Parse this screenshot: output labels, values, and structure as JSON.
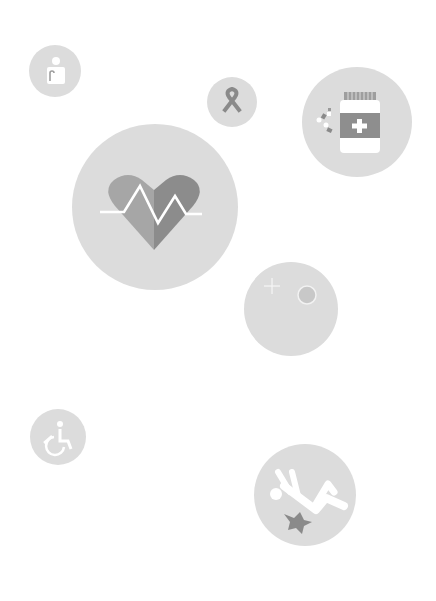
{
  "colors": {
    "background": "#ffffff",
    "circle_fill": "#dcdcdc",
    "icon_dark": "#8a8a8a",
    "icon_mid": "#9e9e9e",
    "icon_light": "#ffffff"
  },
  "icons": [
    {
      "name": "elderly-person-icon",
      "label": "Elderly"
    },
    {
      "name": "awareness-ribbon-icon",
      "label": "Ribbon"
    },
    {
      "name": "medicine-bottle-icon",
      "label": "Medicine"
    },
    {
      "name": "heart-pulse-icon",
      "label": "Heart"
    },
    {
      "name": "cell-icon",
      "label": "Cell"
    },
    {
      "name": "wheelchair-icon",
      "label": "Wheelchair"
    },
    {
      "name": "fall-injury-icon",
      "label": "Fall"
    }
  ]
}
